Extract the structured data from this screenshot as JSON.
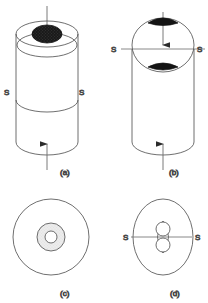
{
  "figure": {
    "background_color": "#ffffff",
    "line_color": "#4a4a4a",
    "fill_dark": "#1a1a1a",
    "fill_light": "#e9e9e9",
    "line_width": 0.8
  },
  "panels": [
    {
      "id": "a",
      "caption": "(a)",
      "caption_x": 63,
      "caption_y": 172,
      "view": "isometric-cylinder-top-nugget",
      "section_labels": [
        {
          "text": "S",
          "x": 5,
          "y": 92
        },
        {
          "text": "S",
          "x": 80,
          "y": 92
        }
      ],
      "arrows": [
        {
          "name": "top-load-arrow",
          "x": 47,
          "y_from": 6,
          "y_to": 30,
          "direction": "down"
        },
        {
          "name": "bottom-load-arrow",
          "x": 47,
          "y_from": 168,
          "y_to": 142,
          "direction": "up"
        }
      ],
      "geometry": {
        "cylinder_cx": 47,
        "cylinder_rx": 31,
        "top_ellipse_cy": 34,
        "top_ellipse_ry": 13,
        "bottom_ellipse_cy": 142,
        "bottom_ellipse_ry": 13,
        "inner_top_ellipse_cy": 45,
        "inner_top_ellipse_ry": 10,
        "mid_ellipse_cy": 100,
        "mid_ellipse_ry": 11,
        "nugget_cx": 47,
        "nugget_cy": 34,
        "nugget_rx": 15,
        "nugget_ry": 9
      }
    },
    {
      "id": "b",
      "caption": "(b)",
      "caption_x": 172,
      "caption_y": 172,
      "view": "section-through-S-S-plane",
      "section_labels": [
        {
          "text": "S",
          "x": 113,
          "y": 52
        },
        {
          "text": "S",
          "x": 190,
          "y": 52
        }
      ],
      "arrows": [
        {
          "name": "top-load-arrow",
          "x": 163,
          "y_from": 12,
          "y_to": 45,
          "direction": "down"
        },
        {
          "name": "bottom-load-arrow",
          "x": 163,
          "y_from": 168,
          "y_to": 143,
          "direction": "up"
        }
      ],
      "geometry": {
        "cylinder_cx": 163,
        "cylinder_rx": 31,
        "top_ellipse_cy": 45,
        "top_ellipse_ry": 27,
        "bottom_ellipse_cy": 142,
        "bottom_ellipse_ry": 13,
        "section_line_y": 49,
        "section_line_x1": 121,
        "section_line_x2": 186,
        "nugget_upper": {
          "cx": 163,
          "cy": 22,
          "rx": 15,
          "ry": 5
        },
        "nugget_lower": {
          "cx": 163,
          "cy": 67,
          "rx": 15,
          "ry": 5
        }
      }
    },
    {
      "id": "c",
      "caption": "(c)",
      "caption_x": 63,
      "caption_y": 294,
      "view": "plan-view-concentric-rings",
      "section_labels": [],
      "arrows": [],
      "geometry": {
        "cx": 51,
        "cy": 237,
        "outer_r": 38,
        "mid_r": 14,
        "inner_r": 6
      }
    },
    {
      "id": "d",
      "caption": "(d)",
      "caption_x": 172,
      "caption_y": 294,
      "view": "plan-view-ellipse-twin-nuggets",
      "section_labels": [
        {
          "text": "S",
          "x": 125,
          "y": 240
        },
        {
          "text": "S",
          "x": 196,
          "y": 240
        }
      ],
      "arrows": [],
      "geometry": {
        "cx": 163,
        "cy": 237,
        "outer_rx": 30,
        "outer_ry": 38,
        "lens_rx": 11,
        "lens_ry": 16,
        "upper_circle": {
          "cx": 163,
          "cy": 228,
          "r": 7
        },
        "lower_circle": {
          "cx": 163,
          "cy": 246,
          "r": 7
        },
        "section_line_y": 237,
        "section_line_x1": 131,
        "section_line_x2": 192
      }
    }
  ],
  "legend": {
    "s_label": "S",
    "description": "S-S denotes the section plane"
  }
}
